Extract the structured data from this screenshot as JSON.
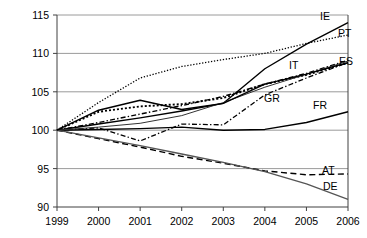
{
  "chart_data": {
    "type": "line",
    "title": "",
    "subtitle": "",
    "xlabel": "",
    "ylabel": "",
    "x": [
      "1999",
      "2000",
      "2001",
      "2002",
      "2003",
      "2004",
      "2005",
      "2006"
    ],
    "xlim": [
      1999,
      2006
    ],
    "ylim": [
      90,
      115
    ],
    "yticks": [
      "90",
      "95",
      "100",
      "105",
      "110",
      "115"
    ],
    "xticks": [
      "1999",
      "2000",
      "2001",
      "2002",
      "2003",
      "2004",
      "2005",
      "2006"
    ],
    "grid": "horizontal",
    "legend": "inline-end-labels",
    "series": [
      {
        "name": "IE",
        "label": "IE",
        "style": "solid",
        "color": "#000000",
        "values": [
          100.0,
          100.8,
          101.6,
          102.5,
          103.5,
          108.0,
          111.2,
          114.0
        ]
      },
      {
        "name": "PT",
        "label": "PT",
        "style": "dotted",
        "color": "#000000",
        "values": [
          100.0,
          103.6,
          106.8,
          108.3,
          109.2,
          110.0,
          111.3,
          112.4
        ]
      },
      {
        "name": "IT",
        "label": "IT",
        "style": "dotted-bold",
        "color": "#000000",
        "values": [
          100.0,
          102.4,
          103.1,
          103.4,
          104.2,
          106.0,
          107.2,
          108.8
        ]
      },
      {
        "name": "ES",
        "label": "ES",
        "style": "dash-dot",
        "color": "#000000",
        "values": [
          100.0,
          101.0,
          102.1,
          103.2,
          104.4,
          106.0,
          107.4,
          109.1
        ]
      },
      {
        "name": "GR",
        "label": "GR",
        "style": "dash-dot-thin",
        "color": "#000000",
        "values": [
          100.0,
          100.3,
          98.6,
          100.8,
          100.7,
          104.6,
          106.8,
          108.8
        ]
      },
      {
        "name": "FR",
        "label": "FR",
        "style": "solid",
        "color": "#000000",
        "values": [
          100.0,
          100.1,
          100.2,
          100.4,
          100.0,
          100.1,
          101.0,
          102.4
        ]
      },
      {
        "name": "AT",
        "label": "AT",
        "style": "dashed",
        "color": "#000000",
        "values": [
          100.0,
          98.9,
          97.8,
          96.6,
          95.7,
          94.7,
          94.2,
          94.3
        ]
      },
      {
        "name": "DE",
        "label": "DE",
        "style": "solid-gray",
        "color": "#555555",
        "values": [
          100.0,
          99.0,
          98.0,
          96.9,
          95.8,
          94.6,
          93.0,
          91.0
        ]
      },
      {
        "name": "SOLID_MID",
        "label": "",
        "style": "solid-thin",
        "color": "#333333",
        "values": [
          100.0,
          100.4,
          100.9,
          101.9,
          103.6,
          105.6,
          107.3,
          109.0
        ]
      },
      {
        "name": "SOLID_PEAK",
        "label": "",
        "style": "solid",
        "color": "#000000",
        "values": [
          100.0,
          102.6,
          103.9,
          102.7,
          103.5,
          106.0,
          107.3,
          108.8
        ]
      }
    ],
    "labels_on_plot": [
      {
        "text": "IE",
        "x": 320,
        "y": 20
      },
      {
        "text": "PT",
        "x": 338,
        "y": 37
      },
      {
        "text": "ES",
        "x": 339,
        "y": 65
      },
      {
        "text": "IT",
        "x": 289,
        "y": 69
      },
      {
        "text": "GR",
        "x": 264,
        "y": 102
      },
      {
        "text": "FR",
        "x": 313,
        "y": 109
      },
      {
        "text": "AT",
        "x": 322,
        "y": 174
      },
      {
        "text": "DE",
        "x": 323,
        "y": 190
      }
    ]
  }
}
